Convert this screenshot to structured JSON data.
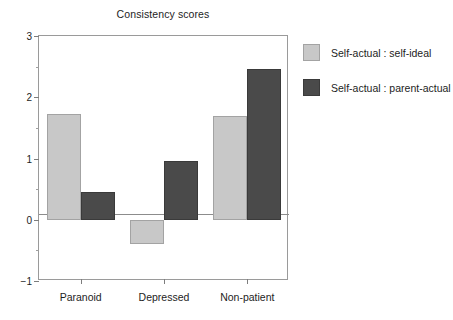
{
  "chart_data": {
    "type": "bar",
    "title": "Consistency scores",
    "xlabel": "",
    "ylabel": "",
    "categories": [
      "Paranoid",
      "Depressed",
      "Non-patient"
    ],
    "series": [
      {
        "name": "Self-actual : self-ideal",
        "color": "#c8c8c8",
        "values": [
          1.73,
          -0.4,
          1.7
        ]
      },
      {
        "name": "Self-actual : parent-actual",
        "color": "#4a4a4a",
        "values": [
          0.46,
          0.96,
          2.46
        ]
      }
    ],
    "ylim": [
      -1,
      3
    ],
    "yticks": [
      3,
      2,
      1,
      0,
      -1
    ],
    "ytick_labels": [
      "3",
      "2",
      "1",
      "0",
      "−1"
    ],
    "yminor_ticks": [
      2.5,
      1.5,
      0.5,
      -0.5
    ],
    "grid": false,
    "legend_position": "right-outside",
    "frame": true
  },
  "legend": {
    "entries": [
      {
        "label": "Self-actual :  self-ideal",
        "swatch": "light-gray-swatch"
      },
      {
        "label": "Self-actual :  parent-actual",
        "swatch": "dark-gray-swatch"
      }
    ]
  }
}
